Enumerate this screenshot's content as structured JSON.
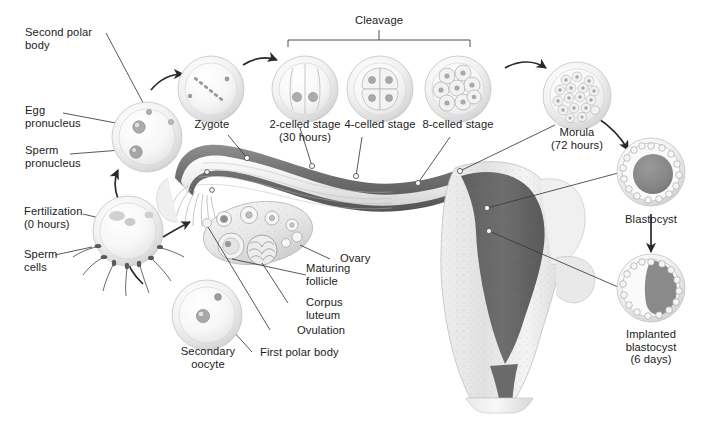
{
  "figure": {
    "background_color": "#ffffff",
    "text_color": "#1b1b1b",
    "line_color": "#3a3a3a"
  },
  "bracket": {
    "label": "Cleavage",
    "span_left_x": 288,
    "span_right_x": 470
  },
  "labels": {
    "second_polar_body": "Second polar\nbody",
    "egg_pronucleus": "Egg\npronucleus",
    "sperm_pronucleus": "Sperm\npronucleus",
    "fertilization": "Fertilization\n(0 hours)",
    "sperm_cells": "Sperm\ncells",
    "secondary_oocyte": "Secondary\noocyte",
    "first_polar_body": "First polar body",
    "ovulation": "Ovulation",
    "corpus_luteum": "Corpus\nluteum",
    "maturing_follicle": "Maturing\nfollicle",
    "ovary": "Ovary",
    "zygote": "Zygote",
    "two_celled": "2-celled stage\n(30 hours)",
    "four_celled": "4-celled stage",
    "eight_celled": "8-celled stage",
    "morula": "Morula\n(72 hours)",
    "blastocyst": "Blastocyst",
    "implanted_blastocyst": "Implanted\nblastocyst\n(6 days)"
  },
  "stages": [
    {
      "key": "secondary_oocyte",
      "name": "Secondary oocyte",
      "time": null,
      "cells": 1
    },
    {
      "key": "fertilization",
      "name": "Fertilization",
      "time": "0 hours",
      "cells": 1
    },
    {
      "key": "zygote",
      "name": "Zygote",
      "time": null,
      "cells": 1
    },
    {
      "key": "two_celled",
      "name": "2-celled stage",
      "time": "30 hours",
      "cells": 2
    },
    {
      "key": "four_celled",
      "name": "4-celled stage",
      "time": null,
      "cells": 4
    },
    {
      "key": "eight_celled",
      "name": "8-celled stage",
      "time": null,
      "cells": 8
    },
    {
      "key": "morula",
      "name": "Morula",
      "time": "72 hours",
      "cells": 20
    },
    {
      "key": "blastocyst",
      "name": "Blastocyst",
      "time": null,
      "cells": null
    },
    {
      "key": "implanted_blastocyst",
      "name": "Implanted blastocyst",
      "time": "6 days",
      "cells": null
    }
  ],
  "anatomy": [
    {
      "key": "ovary",
      "name": "Ovary"
    },
    {
      "key": "maturing_follicle",
      "name": "Maturing follicle"
    },
    {
      "key": "corpus_luteum",
      "name": "Corpus luteum"
    },
    {
      "key": "ovulation",
      "name": "Ovulation"
    },
    {
      "key": "first_polar_body",
      "name": "First polar body"
    },
    {
      "key": "uterine_tube",
      "name": "Uterine tube"
    },
    {
      "key": "uterus",
      "name": "Uterus"
    },
    {
      "key": "endometrium",
      "name": "Endometrium"
    },
    {
      "key": "cervix",
      "name": "Cervix"
    }
  ]
}
